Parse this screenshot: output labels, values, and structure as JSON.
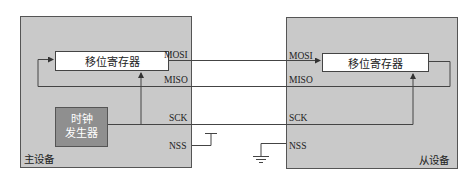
{
  "diagram": {
    "type": "SPI master-slave connection",
    "master": {
      "label": "主设备",
      "shift_register": "移位寄存器",
      "clock_generator": [
        "时钟",
        "发生器"
      ],
      "pins": {
        "mosi": "MOSI",
        "miso": "MISO",
        "sck": "SCK",
        "nss": "NSS"
      }
    },
    "slave": {
      "label": "从设备",
      "shift_register": "移位寄存器",
      "pins": {
        "mosi": "MOSI",
        "miso": "MISO",
        "sck": "SCK",
        "nss": "NSS"
      }
    },
    "connections": [
      {
        "from": "master.MOSI",
        "to": "slave.MOSI"
      },
      {
        "from": "slave.MISO",
        "to": "master.MISO"
      },
      {
        "from": "master.SCK",
        "to": "slave.SCK"
      },
      {
        "from": "master.NSS",
        "to": "VCC (pull-up)"
      },
      {
        "from": "slave.NSS",
        "to": "GND"
      }
    ],
    "colors": {
      "device_fill": "#c9c9c9",
      "clock_fill": "#8f8f8f",
      "register_fill": "#ffffff",
      "line": "#444444"
    }
  }
}
